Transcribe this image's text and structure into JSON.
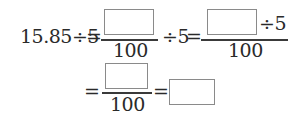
{
  "problem": {
    "lhs": "15.85÷5",
    "eq": "=",
    "div5": "÷5",
    "denominator": "100",
    "blanks": [
      "",
      "",
      "",
      ""
    ]
  }
}
